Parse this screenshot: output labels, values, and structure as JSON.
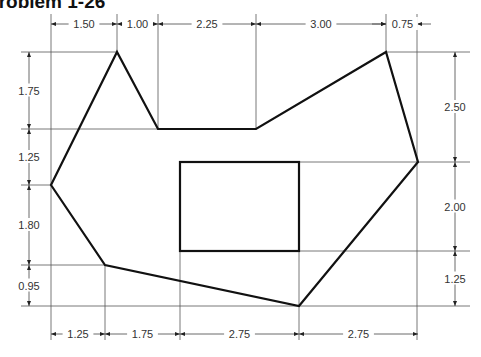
{
  "title": "Problem 1-26",
  "drawing": {
    "outline_polygon": [
      [
        51,
        185
      ],
      [
        117,
        52
      ],
      [
        158,
        129
      ],
      [
        256,
        129
      ],
      [
        386,
        52
      ],
      [
        418,
        162
      ],
      [
        299,
        306
      ],
      [
        105,
        265
      ]
    ],
    "inner_rectangle": {
      "x": 180,
      "y": 162,
      "width": 119,
      "height": 89
    },
    "top_dimensions": [
      {
        "label": "1.50",
        "x1": 51,
        "x2": 117
      },
      {
        "label": "1.00",
        "x1": 117,
        "x2": 158
      },
      {
        "label": "2.25",
        "x1": 158,
        "x2": 256
      },
      {
        "label": "3.00",
        "x1": 256,
        "x2": 386
      },
      {
        "label": "0.75",
        "x1": 386,
        "x2": 417
      }
    ],
    "bottom_dimensions": [
      {
        "label": "1.25",
        "x1": 51,
        "x2": 105
      },
      {
        "label": "1.75",
        "x1": 105,
        "x2": 180
      },
      {
        "label": "2.75",
        "x1": 180,
        "x2": 299
      },
      {
        "label": "2.75",
        "x1": 299,
        "x2": 418
      }
    ],
    "left_dimensions": [
      {
        "label": "1.75",
        "y1": 52,
        "y2": 129
      },
      {
        "label": "1.25",
        "y1": 129,
        "y2": 185
      },
      {
        "label": "1.80",
        "y1": 185,
        "y2": 265
      },
      {
        "label": "0.95",
        "y1": 265,
        "y2": 306
      }
    ],
    "right_dimensions": [
      {
        "label": "2.50",
        "y1": 52,
        "y2": 162
      },
      {
        "label": "2.00",
        "y1": 162,
        "y2": 251
      },
      {
        "label": "1.25",
        "y1": 251,
        "y2": 306
      }
    ]
  }
}
